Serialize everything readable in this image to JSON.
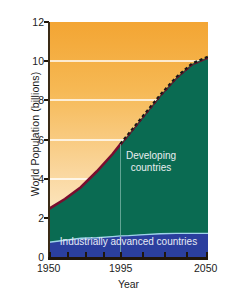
{
  "chart_data": {
    "type": "area",
    "title": "",
    "xlabel": "Year",
    "ylabel": "World Population (billions)",
    "xlim": [
      1950,
      2050
    ],
    "ylim": [
      0,
      12
    ],
    "xticks": [
      1950,
      1995,
      2050
    ],
    "xtick_labels": [
      "1950",
      "1995",
      "2050"
    ],
    "yticks": [
      0,
      2,
      4,
      6,
      8,
      10,
      12
    ],
    "ytick_labels": [
      "0",
      "2",
      "4",
      "6",
      "8",
      "10",
      "12"
    ],
    "gridlines": {
      "orientation": "horizontal",
      "color": "#ffffff",
      "values": [
        2,
        4,
        6,
        8,
        10
      ]
    },
    "projection_divider_year": 1995,
    "series": [
      {
        "name": "Industrially advanced countries",
        "label": "Industrially advanced countries",
        "color": "#2b3f9e",
        "x": [
          1950,
          1960,
          1970,
          1980,
          1990,
          1995,
          2000,
          2010,
          2020,
          2030,
          2040,
          2050
        ],
        "values": [
          0.8,
          0.9,
          1.0,
          1.08,
          1.14,
          1.17,
          1.19,
          1.22,
          1.24,
          1.25,
          1.25,
          1.25
        ]
      },
      {
        "name": "Developing countries",
        "label": "Developing countries",
        "color": "#0a6b52",
        "x": [
          1950,
          1960,
          1970,
          1980,
          1990,
          1995,
          2000,
          2010,
          2020,
          2030,
          2040,
          2050
        ],
        "values": [
          1.7,
          2.1,
          2.6,
          3.3,
          4.1,
          4.6,
          5.1,
          6.1,
          7.1,
          8.0,
          8.7,
          9.0
        ]
      }
    ],
    "total_population": {
      "name": "World population total",
      "x": [
        1950,
        1960,
        1970,
        1980,
        1990,
        1995,
        2000,
        2010,
        2020,
        2030,
        2040,
        2050
      ],
      "values": [
        2.5,
        3.0,
        3.6,
        4.4,
        5.3,
        5.8,
        6.3,
        7.3,
        8.3,
        9.2,
        9.9,
        10.25
      ],
      "observed_color": "#7a0d2e",
      "projected_color": "#1a1a1a",
      "projected_style": "dashed",
      "observed_range": [
        1950,
        1995
      ],
      "projected_range": [
        1995,
        2050
      ]
    },
    "background": {
      "upper_fill_top_color": "#f3a533",
      "upper_fill_bottom_color": "#fdf2db"
    }
  }
}
